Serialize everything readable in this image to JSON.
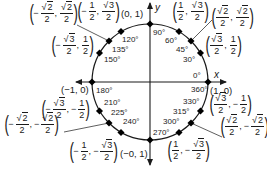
{
  "diagram": {
    "axes": {
      "x_label": "x",
      "y_label": "y"
    },
    "center": {
      "cx": 150,
      "cy": 82
    },
    "radius": 58,
    "colors": {
      "stroke": "#1a1a1a",
      "point": "#000000",
      "background": "#ffffff"
    },
    "angles": [
      {
        "deg": 0,
        "label": "0°"
      },
      {
        "deg": 30,
        "label": "30°"
      },
      {
        "deg": 45,
        "label": "45°"
      },
      {
        "deg": 60,
        "label": "60°"
      },
      {
        "deg": 90,
        "label": "90°"
      },
      {
        "deg": 120,
        "label": "120°"
      },
      {
        "deg": 135,
        "label": "135°"
      },
      {
        "deg": 150,
        "label": "150°"
      },
      {
        "deg": 180,
        "label": "180°"
      },
      {
        "deg": 210,
        "label": "210°"
      },
      {
        "deg": 225,
        "label": "225°"
      },
      {
        "deg": 240,
        "label": "240°"
      },
      {
        "deg": 270,
        "label": "270°"
      },
      {
        "deg": 300,
        "label": "300°"
      },
      {
        "deg": 315,
        "label": "315°"
      },
      {
        "deg": 330,
        "label": "330°"
      },
      {
        "deg": 360,
        "label": "360°"
      }
    ],
    "coordinates": {
      "p0": {
        "text": "(1, 0)"
      },
      "p30": {
        "x": "√3/2",
        "y": "1/2"
      },
      "p45": {
        "x": "√2/2",
        "y": "√2/2"
      },
      "p60": {
        "x": "1/2",
        "y": "√3/2"
      },
      "p90": {
        "text": "(0, 1)"
      },
      "p120": {
        "x": "−1/2",
        "y": "√3/2"
      },
      "p135": {
        "x": "−√2/2",
        "y": "√2/2"
      },
      "p150": {
        "x": "−√3/2",
        "y": "1/2"
      },
      "p180": {
        "text": "(−1, 0)"
      },
      "p210": {
        "x": "−√3/2",
        "y": "−1/2"
      },
      "p225": {
        "x": "−√2/2",
        "y": "−√2/2"
      },
      "p240": {
        "x": "−1/2",
        "y": "−√3/2"
      },
      "p270": {
        "text": "(−0, 1)"
      },
      "p300": {
        "x": "1/2",
        "y": "−√3/2"
      },
      "p315": {
        "x": "√2/2",
        "y": "−√2/2"
      },
      "p330": {
        "x": "√3/2",
        "y": "−1/2"
      }
    },
    "frac_parts": {
      "one": "1",
      "two": "2",
      "three": "3",
      "neg": "−",
      "comma": ",",
      "lparen": "(",
      "rparen": ")",
      "radical": "√"
    }
  }
}
